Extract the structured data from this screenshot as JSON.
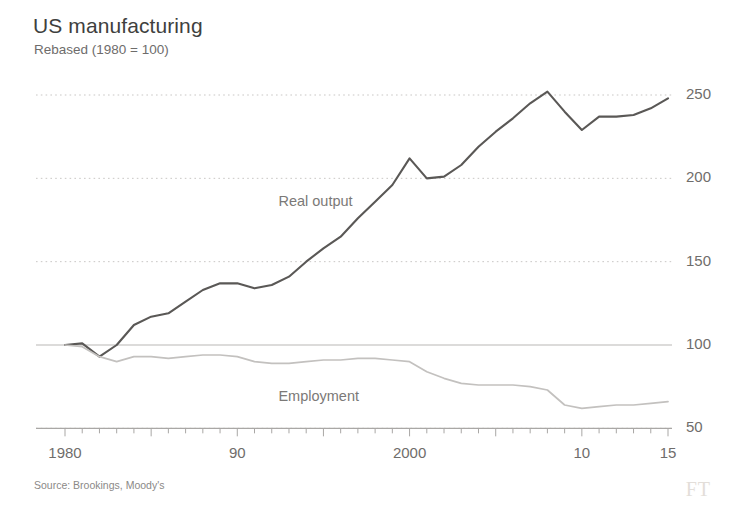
{
  "header": {
    "title": "US manufacturing",
    "subtitle": "Rebased (1980 = 100)"
  },
  "footer": {
    "source": "Source: Brookings, Moody's",
    "logo": "FT"
  },
  "chart_data": {
    "type": "line",
    "title": "US manufacturing",
    "subtitle": "Rebased (1980 = 100)",
    "xlabel": "",
    "ylabel": "",
    "ylim": [
      40,
      265
    ],
    "xlim": [
      1980,
      2015.5
    ],
    "grid": "horizontal-dotted",
    "y_ticks": [
      50,
      100,
      150,
      200,
      250
    ],
    "y_tick_labels": [
      "50",
      "100",
      "150",
      "200",
      "250"
    ],
    "y_axis_position": "right",
    "x_ticks": [
      1980,
      1985,
      1990,
      1995,
      2000,
      2005,
      2010,
      2015
    ],
    "x_tick_labels_shown": [
      {
        "value": 1980,
        "label": "1980"
      },
      {
        "value": 1990,
        "label": "90"
      },
      {
        "value": 2000,
        "label": "2000"
      },
      {
        "value": 2010,
        "label": "10"
      },
      {
        "value": 2015,
        "label": "15"
      }
    ],
    "x_minor_tick_interval": 1,
    "baseline_value": 100,
    "legend": "inline-annotations",
    "annotations": [
      {
        "text": "Real output",
        "x": 1995.0,
        "y": 185
      },
      {
        "text": "Employment",
        "x": 1995.0,
        "y": 68
      }
    ],
    "x": [
      1980,
      1981,
      1982,
      1983,
      1984,
      1985,
      1986,
      1987,
      1988,
      1989,
      1990,
      1991,
      1992,
      1993,
      1994,
      1995,
      1996,
      1997,
      1998,
      1999,
      2000,
      2001,
      2002,
      2003,
      2004,
      2005,
      2006,
      2007,
      2008,
      2009,
      2010,
      2011,
      2012,
      2013,
      2014,
      2015
    ],
    "series": [
      {
        "name": "Real output",
        "color": "#5a5856",
        "values": [
          100,
          101,
          93,
          100,
          112,
          117,
          119,
          126,
          133,
          137,
          137,
          134,
          136,
          141,
          150,
          158,
          165,
          176,
          186,
          196,
          212,
          200,
          201,
          208,
          219,
          228,
          236,
          245,
          252,
          240,
          229,
          237,
          237,
          238,
          242,
          248
        ]
      },
      {
        "name": "Employment",
        "color": "#c3c1bf",
        "values": [
          100,
          99,
          93,
          90,
          93,
          93,
          92,
          93,
          94,
          94,
          93,
          90,
          89,
          89,
          90,
          91,
          91,
          92,
          92,
          91,
          90,
          84,
          80,
          77,
          76,
          76,
          76,
          75,
          73,
          64,
          62,
          63,
          64,
          64,
          65,
          66
        ]
      }
    ]
  }
}
